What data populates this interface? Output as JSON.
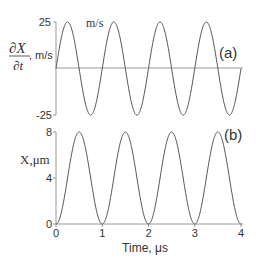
{
  "chart_data": [
    {
      "type": "line",
      "panel_label": "(a)",
      "title": "",
      "ylabel_num": "∂X",
      "ylabel_den": "∂t",
      "ylabel_unit": ", m/s",
      "annotation": "m/s",
      "xlabel": "",
      "xlim": [
        0,
        4
      ],
      "ylim": [
        -25,
        25
      ],
      "yticks": [
        "25",
        "-25"
      ],
      "ytick_values": [
        25,
        -25
      ],
      "zero_line": true,
      "function": "25*sin(2*pi*t)",
      "amplitude": 25,
      "period": 1,
      "series": [
        {
          "name": "velocity",
          "x": [
            0,
            0.25,
            0.5,
            0.75,
            1,
            1.25,
            1.5,
            1.75,
            2,
            2.25,
            2.5,
            2.75,
            3,
            3.25,
            3.5,
            3.75,
            4
          ],
          "y": [
            0,
            25,
            0,
            -25,
            0,
            25,
            0,
            -25,
            0,
            25,
            0,
            -25,
            0,
            25,
            0,
            -25,
            0
          ]
        }
      ]
    },
    {
      "type": "line",
      "panel_label": "(b)",
      "ylabel": "X,μm",
      "xlabel": "Time, μs",
      "xlim": [
        0,
        4
      ],
      "ylim": [
        0,
        8
      ],
      "yticks": [
        "8",
        "4",
        "0"
      ],
      "ytick_values": [
        8,
        4,
        0
      ],
      "xticks": [
        "0",
        "1",
        "2",
        "3",
        "4"
      ],
      "xtick_values": [
        0,
        1,
        2,
        3,
        4
      ],
      "function": "4*(1-cos(2*pi*t))",
      "amplitude": 8,
      "period": 1,
      "series": [
        {
          "name": "displacement",
          "x": [
            0,
            0.5,
            1,
            1.5,
            2,
            2.5,
            3,
            3.5,
            4
          ],
          "y": [
            0,
            8,
            0,
            8,
            0,
            8,
            0,
            8,
            0
          ]
        }
      ]
    }
  ]
}
